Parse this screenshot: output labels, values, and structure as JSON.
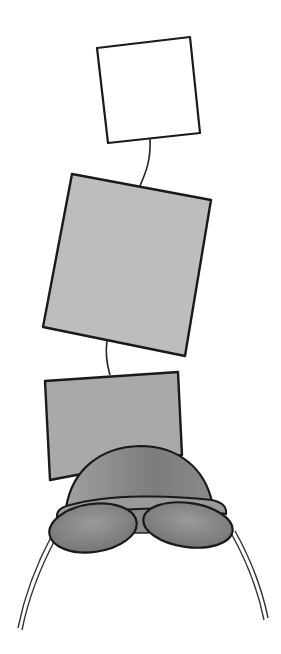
{
  "diagram": {
    "type": "schematic-illustration",
    "elements": [
      {
        "id": "top-square",
        "fill": "#ffffff",
        "stroke": "#1a1a1a"
      },
      {
        "id": "middle-square",
        "fill": "#bdbdbd",
        "stroke": "#1a1a1a"
      },
      {
        "id": "bottom-square",
        "fill": "#a9a9a9",
        "stroke": "#1a1a1a"
      },
      {
        "id": "dome-cap",
        "fill": "#8e8e8e",
        "stroke": "#1a1a1a"
      },
      {
        "id": "left-lobe",
        "fill": "#8a8a8a",
        "stroke": "#1a1a1a"
      },
      {
        "id": "right-lobe",
        "fill": "#8a8a8a",
        "stroke": "#1a1a1a"
      },
      {
        "id": "left-arc",
        "stroke": "#333333"
      },
      {
        "id": "right-arc",
        "stroke": "#333333"
      }
    ],
    "connectors": [
      {
        "from": "top-square",
        "to": "middle-square"
      },
      {
        "from": "middle-square",
        "to": "bottom-square"
      }
    ]
  }
}
